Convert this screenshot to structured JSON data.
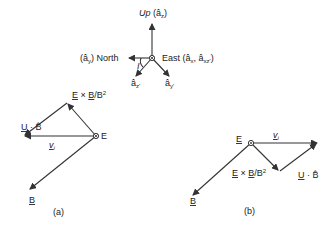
{
  "axes": {
    "up_label": "Up (â",
    "up_sub": "z",
    "north_label": "North",
    "north_prefix": "(â",
    "north_sub": "y",
    "east_label": "East (â",
    "east_sub1": "x",
    "east_mid": ", â",
    "east_sub2": "xz'",
    "azp_label": "â",
    "azp_sub": "z'",
    "ayp_label": "â",
    "ayp_sub": "y'",
    "angle_label": "I"
  },
  "diagram_a": {
    "caption": "(a)",
    "exb_label": "E × B/B²",
    "ub_label": "U · B̂",
    "vi_label": "v",
    "vi_sub": "i",
    "e_label": "E",
    "b_label": "B"
  },
  "diagram_b": {
    "caption": "(b)",
    "exb_label": "E × B/B²",
    "ub_label": "U · B̂",
    "vi_label": "v",
    "vi_sub": "i",
    "e_label": "E",
    "b_label": "B"
  },
  "colors": {
    "ink": "#333333",
    "background": "#ffffff"
  }
}
